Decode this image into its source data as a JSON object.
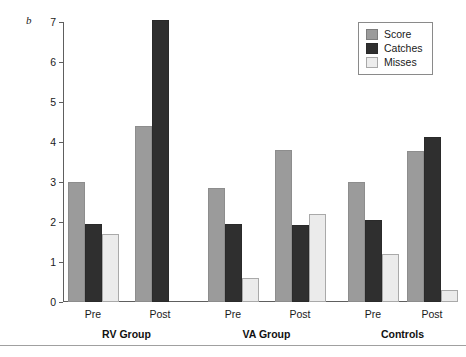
{
  "panel": {
    "label": "b"
  },
  "legend": {
    "position": "top-right",
    "items": [
      {
        "name": "Score",
        "color": "#9b9b9b"
      },
      {
        "name": "Catches",
        "color": "#2f2f2f"
      },
      {
        "name": "Misses",
        "color": "#ebebeb"
      }
    ]
  },
  "chart_data": {
    "type": "bar",
    "title": "",
    "subtitle": "",
    "xlabel": "",
    "ylabel": "",
    "ylim": [
      0,
      7
    ],
    "yticks": [
      0,
      1,
      2,
      3,
      4,
      5,
      6,
      7
    ],
    "ytick_labels": [
      "0",
      "1",
      "2",
      "3",
      "4",
      "5",
      "6",
      "7"
    ],
    "grid": false,
    "legend_position": "top-right",
    "categories": [
      "Pre",
      "Post",
      "Pre",
      "Post",
      "Pre",
      "Post"
    ],
    "groups": [
      {
        "label": "RV Group",
        "categories": [
          "Pre",
          "Post"
        ]
      },
      {
        "label": "VA Group",
        "categories": [
          "Pre",
          "Post"
        ]
      },
      {
        "label": "Controls",
        "categories": [
          "Pre",
          "Post"
        ]
      }
    ],
    "series": [
      {
        "name": "Score",
        "color": "#9b9b9b",
        "values": [
          3.0,
          4.4,
          2.85,
          3.8,
          3.0,
          3.77
        ]
      },
      {
        "name": "Catches",
        "color": "#2f2f2f",
        "values": [
          1.95,
          7.05,
          1.95,
          1.93,
          2.05,
          4.13
        ]
      },
      {
        "name": "Misses",
        "color": "#ebebeb",
        "values": [
          1.7,
          0.0,
          0.6,
          2.2,
          1.2,
          0.3
        ]
      }
    ]
  }
}
